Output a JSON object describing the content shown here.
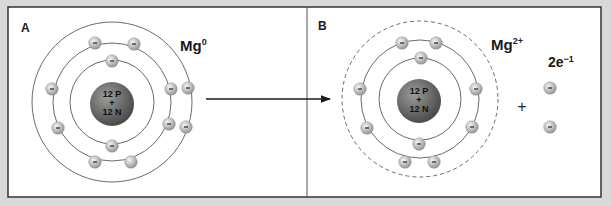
{
  "colors": {
    "background": "#d9d9d9",
    "panel": "#ffffff",
    "border": "#333333",
    "orbit": "#444444",
    "nucleus_light": "#8a8a8a",
    "nucleus_dark": "#4f4f4f",
    "electron_light": "#f0f0f0",
    "electron_dark": "#9a9a9a"
  },
  "panel_a": {
    "label": "A",
    "species": "Mg",
    "superscript": "0",
    "nucleus": {
      "line1": "12 P",
      "line2": "+",
      "line3": "12 N"
    },
    "shells": [
      2,
      8,
      2
    ]
  },
  "panel_b": {
    "label": "B",
    "species": "Mg",
    "superscript": "2+",
    "nucleus": {
      "line1": "12 P",
      "line2": "+",
      "line3": "12 N"
    },
    "shells": [
      2,
      8
    ],
    "plus": "+",
    "released": {
      "label": "2e",
      "superscript": "−1",
      "count": 2
    }
  },
  "electron_symbol": "–"
}
